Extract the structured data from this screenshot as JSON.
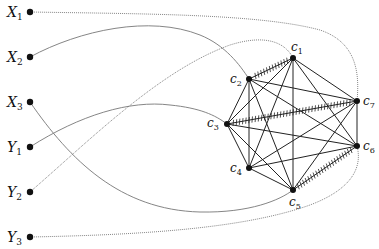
{
  "diagram": {
    "left_nodes": [
      {
        "id": "X1",
        "base": "X",
        "sub": "1",
        "x": 30,
        "y": 12
      },
      {
        "id": "X2",
        "base": "X",
        "sub": "2",
        "x": 30,
        "y": 57
      },
      {
        "id": "X3",
        "base": "X",
        "sub": "3",
        "x": 30,
        "y": 102
      },
      {
        "id": "Y1",
        "base": "Y",
        "sub": "1",
        "x": 30,
        "y": 147
      },
      {
        "id": "Y2",
        "base": "Y",
        "sub": "2",
        "x": 30,
        "y": 192
      },
      {
        "id": "Y3",
        "base": "Y",
        "sub": "3",
        "x": 30,
        "y": 237
      }
    ],
    "clique_nodes": [
      {
        "id": "c1",
        "base": "c",
        "sub": "1",
        "x": 293,
        "y": 58
      },
      {
        "id": "c2",
        "base": "c",
        "sub": "2",
        "x": 249,
        "y": 79
      },
      {
        "id": "c3",
        "base": "c",
        "sub": "3",
        "x": 227,
        "y": 124
      },
      {
        "id": "c4",
        "base": "c",
        "sub": "4",
        "x": 249,
        "y": 168
      },
      {
        "id": "c5",
        "base": "c",
        "sub": "5",
        "x": 293,
        "y": 190
      },
      {
        "id": "c6",
        "base": "c",
        "sub": "6",
        "x": 357,
        "y": 146
      },
      {
        "id": "c7",
        "base": "c",
        "sub": "7",
        "x": 357,
        "y": 101
      }
    ],
    "hatched_edges": [
      [
        "c1",
        "c2"
      ],
      [
        "c3",
        "c7"
      ],
      [
        "c5",
        "c6"
      ]
    ],
    "connections": [
      {
        "from": "X1",
        "to": "c7",
        "style": "dotted"
      },
      {
        "from": "X2",
        "to": "c2",
        "style": "solid"
      },
      {
        "from": "X3",
        "to": "c5",
        "style": "solid"
      },
      {
        "from": "Y1",
        "to": "c3",
        "style": "solid"
      },
      {
        "from": "Y2",
        "to": "c1",
        "style": "dotted"
      },
      {
        "from": "Y3",
        "to": "c6",
        "style": "dotted"
      }
    ]
  }
}
